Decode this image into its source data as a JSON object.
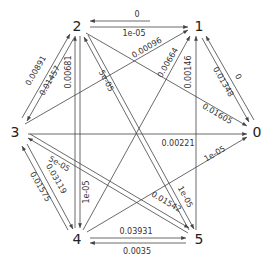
{
  "diagram": {
    "type": "directed-graph",
    "nodes": [
      {
        "id": "0",
        "label": "0",
        "x": 256,
        "y": 131
      },
      {
        "id": "1",
        "label": "1",
        "x": 199,
        "y": 28
      },
      {
        "id": "2",
        "label": "2",
        "x": 77,
        "y": 28
      },
      {
        "id": "3",
        "label": "3",
        "x": 15,
        "y": 131
      },
      {
        "id": "4",
        "label": "4",
        "x": 77,
        "y": 240
      },
      {
        "id": "5",
        "label": "5",
        "x": 199,
        "y": 240
      }
    ],
    "edges": [
      {
        "from": "1",
        "to": "2",
        "label": "0"
      },
      {
        "from": "2",
        "to": "1",
        "label": "1e-05"
      },
      {
        "from": "3",
        "to": "1",
        "label": "0.00096"
      },
      {
        "from": "4",
        "to": "1",
        "label": "0.00664"
      },
      {
        "from": "5",
        "to": "1",
        "label": "0.00146"
      },
      {
        "from": "0",
        "to": "1",
        "label": "0"
      },
      {
        "from": "1",
        "to": "0",
        "label": "0.01348"
      },
      {
        "from": "2",
        "to": "0",
        "label": "0.01605"
      },
      {
        "from": "3",
        "to": "0",
        "label": "0.00221"
      },
      {
        "from": "4",
        "to": "0",
        "label": "1e-05"
      },
      {
        "from": "3",
        "to": "2",
        "label": "0.00891"
      },
      {
        "from": "2",
        "to": "3",
        "label": "0.01457"
      },
      {
        "from": "4",
        "to": "2",
        "label": "0.00681"
      },
      {
        "from": "2",
        "to": "4",
        "label": "1e-05"
      },
      {
        "from": "5",
        "to": "2",
        "label": "5e-05"
      },
      {
        "from": "2",
        "to": "5",
        "label": "1e-05"
      },
      {
        "from": "5",
        "to": "3",
        "label": "5e-05"
      },
      {
        "from": "3",
        "to": "5",
        "label": "0.01542"
      },
      {
        "from": "4",
        "to": "3",
        "label": "0.01575"
      },
      {
        "from": "3",
        "to": "4",
        "label": "0.03119"
      },
      {
        "from": "4",
        "to": "5",
        "label": "0.03931"
      },
      {
        "from": "5",
        "to": "4",
        "label": "0.0035"
      }
    ]
  },
  "labels": {
    "n0": "0",
    "n1": "1",
    "n2": "2",
    "n3": "3",
    "n4": "4",
    "n5": "5",
    "e_1_2": "0",
    "e_2_1": "1e-05",
    "e_3_1": "0.00096",
    "e_4_1": "0.00664",
    "e_5_1": "0.00146",
    "e_0_1": "0",
    "e_1_0": "0.01348",
    "e_2_0": "0.01605",
    "e_3_0": "0.00221",
    "e_4_0": "1e-05",
    "e_3_2": "0.00891",
    "e_2_3": "0.01457",
    "e_4_2": "0.00681",
    "e_2_4": "1e-05",
    "e_5_2": "5e-05",
    "e_2_5": "1e-05",
    "e_5_3": "5e-05",
    "e_3_5": "0.01542",
    "e_4_3": "0.01575",
    "e_3_4": "0.03119",
    "e_4_5": "0.03931",
    "e_5_4": "0.0035"
  }
}
